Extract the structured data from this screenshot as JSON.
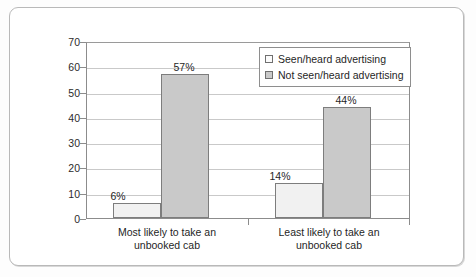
{
  "chart_data": {
    "type": "bar",
    "title": "",
    "xlabel": "",
    "ylabel": "",
    "ylim": [
      0,
      70
    ],
    "ytick_step": 10,
    "yticks": [
      "70",
      "60",
      "50",
      "40",
      "30",
      "20",
      "10",
      "0"
    ],
    "grid": true,
    "legend_position": "top-right-inside",
    "categories": [
      "Most likely to take an unbooked cab",
      "Least likely to take an unbooked cab"
    ],
    "category_lines": [
      [
        "Most likely to take an",
        "unbooked cab"
      ],
      [
        "Least likely to take an",
        "unbooked cab"
      ]
    ],
    "series": [
      {
        "name": "Seen/heard advertising",
        "values": [
          6,
          57
        ],
        "labels": [
          "6%",
          "57%"
        ],
        "color": "#f1f1f1",
        "border": "#7d7d7d"
      },
      {
        "name": "Not seen/heard advertising",
        "values": [
          14,
          44
        ],
        "labels": [
          "14%",
          "44%"
        ],
        "color": "#c9c9c9",
        "border": "#7d7d7d"
      }
    ],
    "bars": [
      {
        "group": 0,
        "series": 0,
        "value": 6,
        "label": "6%"
      },
      {
        "group": 0,
        "series": 1,
        "value": 57,
        "label": "57%"
      },
      {
        "group": 1,
        "series": 0,
        "value": 14,
        "label": "14%"
      },
      {
        "group": 1,
        "series": 1,
        "value": 44,
        "label": "44%"
      }
    ]
  },
  "legend": {
    "items": [
      {
        "label": "Seen/heard advertising",
        "swatch": "light"
      },
      {
        "label": "Not seen/heard advertising",
        "swatch": "dark"
      }
    ]
  },
  "axis": {
    "y_labels": [
      "70",
      "60",
      "50",
      "40",
      "30",
      "20",
      "10",
      "0"
    ]
  },
  "colors": {
    "bar_light": "#f1f1f1",
    "bar_dark": "#c9c9c9",
    "bar_border": "#7d7d7d",
    "gridline": "#c9c9c9",
    "axis": "#8c8c8c",
    "frame": "#b9b9b9",
    "text": "#1f1f1f"
  }
}
